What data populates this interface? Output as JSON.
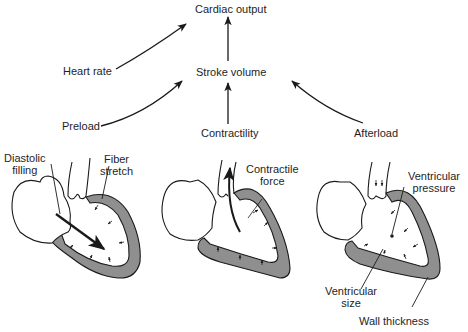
{
  "diagram": {
    "nodes": {
      "cardiac_output": "Cardiac output",
      "stroke_volume": "Stroke volume",
      "heart_rate": "Heart rate",
      "preload": "Preload",
      "contractility": "Contractility",
      "afterload": "Afterload"
    },
    "edges": [
      {
        "from": "Heart rate",
        "to": "Cardiac output"
      },
      {
        "from": "Stroke volume",
        "to": "Cardiac output"
      },
      {
        "from": "Preload",
        "to": "Stroke volume"
      },
      {
        "from": "Contractility",
        "to": "Stroke volume"
      },
      {
        "from": "Afterload",
        "to": "Stroke volume"
      }
    ],
    "hearts": {
      "preload": {
        "label_1_line1": "Diastolic",
        "label_1_line2": "filling",
        "label_2_line1": "Fiber",
        "label_2_line2": "stretch"
      },
      "contractility": {
        "label_1_line1": "Contractile",
        "label_1_line2": "force"
      },
      "afterload": {
        "label_1_line1": "Ventricular",
        "label_1_line2": "pressure",
        "label_2_line1": "Ventricular",
        "label_2_line2": "size",
        "label_3": "Wall thickness"
      }
    },
    "colors": {
      "line": "#1a1a1a",
      "wall_fill": "#8f8f8f",
      "background": "#ffffff"
    }
  }
}
